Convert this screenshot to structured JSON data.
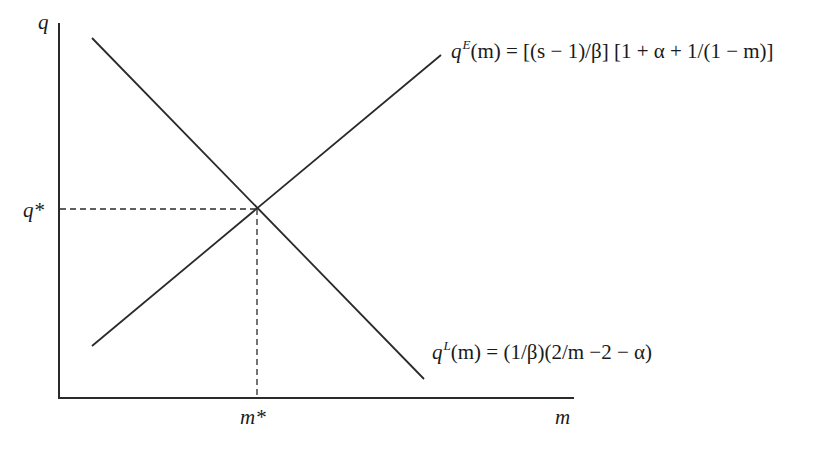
{
  "diagram": {
    "type": "supply-demand style intersection diagram",
    "axes": {
      "y_label": "q",
      "x_label": "m"
    },
    "equilibrium": {
      "q_label": "q*",
      "m_label": "m*"
    },
    "curves": [
      {
        "id": "qE",
        "direction": "upward",
        "symbol": "q",
        "superscript": "E",
        "argument": "(m)",
        "rhs": " = [(s − 1)/β] [1 + α + 1/(1 − m)]"
      },
      {
        "id": "qL",
        "direction": "downward",
        "symbol": "q",
        "superscript": "L",
        "argument": "(m)",
        "rhs": " = (1/β)(2/m −2 − α)"
      }
    ],
    "colors": {
      "line": "#2a2a2a",
      "background": "#ffffff"
    }
  }
}
